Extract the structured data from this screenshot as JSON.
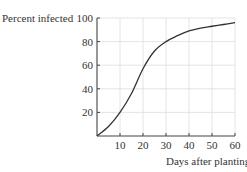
{
  "chart_data": {
    "type": "line",
    "title": "",
    "xlabel": "Days after planting",
    "ylabel": "Percent infected",
    "xlim": [
      0,
      60
    ],
    "ylim": [
      0,
      100
    ],
    "xticks": [
      10,
      20,
      30,
      40,
      50,
      60
    ],
    "yticks": [
      20,
      40,
      60,
      80,
      100
    ],
    "grid": true,
    "series": [
      {
        "name": "Percent infected",
        "x": [
          0,
          5,
          10,
          15,
          20,
          25,
          30,
          35,
          40,
          45,
          50,
          55,
          60
        ],
        "values": [
          0,
          8,
          20,
          36,
          57,
          72,
          80,
          85,
          89,
          91.5,
          93,
          94.5,
          96
        ]
      }
    ]
  },
  "colors": {
    "curve": "#333333",
    "axis": "#444444",
    "grid": "#dddddd"
  }
}
